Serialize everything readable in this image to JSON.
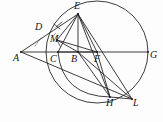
{
  "figure": {
    "canvas": {
      "width": 163,
      "height": 122
    },
    "stroke_color": "#272727",
    "circle_color": "#333333",
    "background": "#fdfdfd"
  },
  "circle": {
    "center_x": 97,
    "center_y": 52,
    "radius": 51
  },
  "points": {
    "A": {
      "label": "A",
      "x": 21,
      "y": 52,
      "label_x": 13,
      "label_y": 53
    },
    "B": {
      "label": "B",
      "x": 78,
      "y": 52,
      "label_x": 71,
      "label_y": 54
    },
    "C": {
      "label": "C",
      "x": 58,
      "y": 52,
      "label_x": 50,
      "label_y": 54
    },
    "D": {
      "label": "D",
      "x": 46,
      "y": 33,
      "label_x": 35,
      "label_y": 22
    },
    "E": {
      "label": "E",
      "x": 78,
      "y": 14,
      "label_x": 74,
      "label_y": 1
    },
    "F": {
      "label": "F",
      "x": 97,
      "y": 52,
      "label_x": 94,
      "label_y": 54
    },
    "G": {
      "label": "G",
      "x": 148,
      "y": 52,
      "label_x": 150,
      "label_y": 50
    },
    "H": {
      "label": "H",
      "x": 110,
      "y": 97,
      "label_x": 106,
      "label_y": 98
    },
    "L": {
      "label": "L",
      "x": 132,
      "y": 99,
      "label_x": 133,
      "label_y": 98
    },
    "M": {
      "label": "M",
      "x": 57,
      "y": 40,
      "label_x": 50,
      "label_y": 34
    }
  },
  "segments": [
    {
      "name": "A-E",
      "from": "A",
      "to": "E"
    },
    {
      "name": "A-G",
      "from": "A",
      "to": "G"
    },
    {
      "name": "A-L",
      "from": "A",
      "to": "L"
    },
    {
      "name": "E-C",
      "from": "E",
      "to": "C"
    },
    {
      "name": "E-B",
      "from": "E",
      "to": "B"
    },
    {
      "name": "E-F",
      "from": "E",
      "to": "F"
    },
    {
      "name": "E-M",
      "from": "E",
      "to": "M"
    },
    {
      "name": "E-H",
      "from": "E",
      "to": "H"
    },
    {
      "name": "E-L",
      "from": "E",
      "to": "L"
    },
    {
      "name": "M-F",
      "from": "M",
      "to": "F"
    },
    {
      "name": "M-B",
      "from": "M",
      "to": "B"
    },
    {
      "name": "C-F",
      "from": "C",
      "to": "F"
    },
    {
      "name": "B-F",
      "from": "B",
      "to": "F"
    },
    {
      "name": "B-H",
      "from": "B",
      "to": "H"
    },
    {
      "name": "B-L",
      "from": "B",
      "to": "L"
    },
    {
      "name": "F-H",
      "from": "F",
      "to": "H"
    },
    {
      "name": "H-L",
      "from": "H",
      "to": "L"
    }
  ],
  "arcs": [
    {
      "name": "circle-outline",
      "description": "main circle through E, G, H"
    },
    {
      "name": "arc-C-H",
      "description": "arc from C down through bottom to H"
    }
  ],
  "marks": [
    {
      "name": "angle-mark-A",
      "description": "dashed angle bisector indicator at A"
    },
    {
      "name": "tick-D",
      "description": "congruence tick on segment A-E near D"
    },
    {
      "name": "tick-M",
      "description": "congruence tick near M"
    }
  ]
}
